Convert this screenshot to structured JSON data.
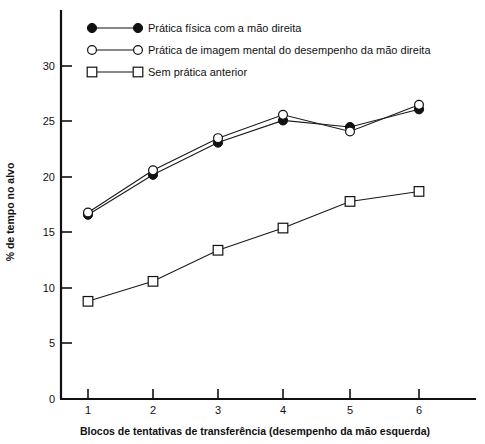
{
  "chart_data": {
    "type": "line",
    "title": "",
    "subtitle": "",
    "xlabel": "Blocos de tentativas de transferência (desempenho da mão esquerda)",
    "ylabel": "% de tempo no alvo",
    "x": [
      1,
      2,
      3,
      4,
      5,
      6
    ],
    "categories": [
      "1",
      "2",
      "3",
      "4",
      "5",
      "6"
    ],
    "xticklabels": [
      "1",
      "2",
      "3",
      "4",
      "5",
      "6"
    ],
    "yticklabels": [
      "0",
      "5",
      "10",
      "15",
      "20",
      "25",
      "30"
    ],
    "yticks": [
      0,
      5,
      10,
      15,
      20,
      25,
      30
    ],
    "xlim": [
      0.6,
      6.9
    ],
    "ylim": [
      0,
      32.5
    ],
    "grid": false,
    "legend_position": "top-left inside",
    "series": [
      {
        "name": "Prática física com a mão direita",
        "marker": "filled-circle",
        "values": [
          16.6,
          20.2,
          23.1,
          25.1,
          24.5,
          26.1
        ]
      },
      {
        "name": "Prática de imagem mental do desempenho da mão direita",
        "marker": "open-circle",
        "values": [
          16.8,
          20.6,
          23.5,
          25.6,
          24.1,
          26.5
        ]
      },
      {
        "name": "Sem prática anterior",
        "marker": "open-square",
        "values": [
          8.8,
          10.6,
          13.4,
          15.4,
          17.8,
          18.7
        ]
      }
    ]
  },
  "legend": {
    "items": [
      {
        "label": "Prática física com a mão direita",
        "marker": "filled-circle"
      },
      {
        "label": "Prática de imagem mental do desempenho da mão direita",
        "marker": "open-circle"
      },
      {
        "label": "Sem prática anterior",
        "marker": "open-square"
      }
    ]
  },
  "axes": {
    "y_title": "% de tempo no alvo",
    "x_title": "Blocos de tentativas de transferência (desempenho da mão esquerda)",
    "y_ticks": [
      "30",
      "25",
      "20",
      "15",
      "10",
      "5",
      "0"
    ],
    "x_ticks": [
      "1",
      "2",
      "3",
      "4",
      "5",
      "6"
    ]
  },
  "colors": {
    "ink": "#111111",
    "background": "#ffffff"
  }
}
